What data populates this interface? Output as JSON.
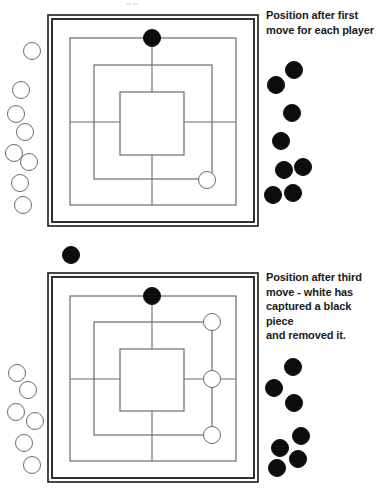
{
  "figure": {
    "title_sliver": "g   p",
    "background_color": "#ffffff",
    "piece_colors": {
      "black": "#0d0d0d",
      "white": "#ffffff",
      "white_outline": "#6b6b6b"
    },
    "board_line_color": "#6b6b6b",
    "board_frame_color": "#1a1a1a"
  },
  "panels": [
    {
      "id": "panel-top",
      "caption": "Position after first\nmove for each player",
      "board": {
        "name": "nine-mens-morris-board",
        "frame": {
          "x": 48,
          "y": 15,
          "w": 210,
          "h": 211,
          "inner_inset": 4
        },
        "rings": [
          {
            "x": 70,
            "y": 38,
            "w": 166,
            "h": 167
          },
          {
            "x": 94,
            "y": 65,
            "w": 118,
            "h": 114
          },
          {
            "x": 120,
            "y": 92,
            "w": 64,
            "h": 63
          }
        ],
        "spokes": {
          "cx": 152,
          "cy": 122
        },
        "pieces_on_board": [
          {
            "color": "black",
            "x": 152,
            "y": 38,
            "r": 9,
            "point": "top-middle-outer-ring"
          },
          {
            "color": "white",
            "x": 207,
            "y": 180,
            "r": 9,
            "point": "bottom-right-area-middle-ring"
          }
        ]
      },
      "reserve_white": [
        {
          "x": 32,
          "y": 51,
          "r": 9
        },
        {
          "x": 21,
          "y": 90,
          "r": 9
        },
        {
          "x": 16,
          "y": 114,
          "r": 9
        },
        {
          "x": 25,
          "y": 132,
          "r": 9
        },
        {
          "x": 14,
          "y": 153,
          "r": 9
        },
        {
          "x": 29,
          "y": 162,
          "r": 9
        },
        {
          "x": 20,
          "y": 183,
          "r": 9
        },
        {
          "x": 23,
          "y": 205,
          "r": 9
        }
      ],
      "reserve_black": [
        {
          "x": 294,
          "y": 70,
          "r": 9
        },
        {
          "x": 276,
          "y": 85,
          "r": 9
        },
        {
          "x": 292,
          "y": 113,
          "r": 9
        },
        {
          "x": 281,
          "y": 141,
          "r": 9
        },
        {
          "x": 284,
          "y": 170,
          "r": 9
        },
        {
          "x": 303,
          "y": 167,
          "r": 9
        },
        {
          "x": 273,
          "y": 195,
          "r": 9
        },
        {
          "x": 293,
          "y": 193,
          "r": 9
        }
      ]
    },
    {
      "id": "panel-bottom",
      "caption": "Position after third\nmove - white has\ncaptured a black piece\nand removed it.",
      "board": {
        "name": "nine-mens-morris-board",
        "frame": {
          "x": 48,
          "y": 273,
          "w": 210,
          "h": 209,
          "inner_inset": 4
        },
        "rings": [
          {
            "x": 70,
            "y": 296,
            "w": 166,
            "h": 165
          },
          {
            "x": 94,
            "y": 322,
            "w": 118,
            "h": 113
          },
          {
            "x": 120,
            "y": 349,
            "w": 64,
            "h": 62
          }
        ],
        "spokes": {
          "cx": 152,
          "cy": 379
        },
        "pieces_on_board": [
          {
            "color": "black",
            "x": 152,
            "y": 296,
            "r": 9,
            "point": "top-middle-outer-ring"
          },
          {
            "color": "white",
            "x": 212,
            "y": 322,
            "r": 9,
            "point": "top-right-middle-ring"
          },
          {
            "color": "white",
            "x": 212,
            "y": 379,
            "r": 9,
            "point": "right-middle-ring"
          },
          {
            "color": "white",
            "x": 212,
            "y": 435,
            "r": 9,
            "point": "bottom-right-middle-ring"
          }
        ]
      },
      "reserve_white": [
        {
          "x": 17,
          "y": 373,
          "r": 9
        },
        {
          "x": 28,
          "y": 390,
          "r": 9
        },
        {
          "x": 16,
          "y": 412,
          "r": 9
        },
        {
          "x": 35,
          "y": 421,
          "r": 9
        },
        {
          "x": 24,
          "y": 443,
          "r": 9
        },
        {
          "x": 32,
          "y": 465,
          "r": 9
        }
      ],
      "reserve_black": [
        {
          "x": 293,
          "y": 367,
          "r": 9
        },
        {
          "x": 274,
          "y": 388,
          "r": 9
        },
        {
          "x": 294,
          "y": 403,
          "r": 9
        },
        {
          "x": 301,
          "y": 436,
          "r": 9
        },
        {
          "x": 280,
          "y": 448,
          "r": 9
        },
        {
          "x": 298,
          "y": 459,
          "r": 9
        },
        {
          "x": 277,
          "y": 468,
          "r": 9
        }
      ]
    }
  ],
  "loose_pieces": [
    {
      "color": "black",
      "x": 71,
      "y": 255,
      "r": 9,
      "label": "captured-black-piece"
    }
  ]
}
